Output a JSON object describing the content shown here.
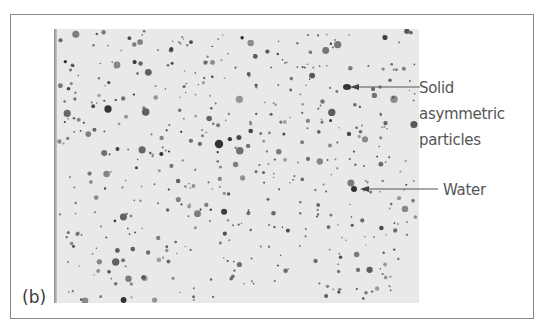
{
  "figure": {
    "panel_label": "(b)",
    "annotations": [
      {
        "id": "solid",
        "lines": [
          "Solid",
          "asymmetric",
          "particles"
        ]
      },
      {
        "id": "water",
        "lines": [
          "Water"
        ]
      }
    ]
  },
  "micrograph": {
    "background": "#e9e9e7",
    "particle_color": "#3c3c3c",
    "seed": 7,
    "particle_count": 520
  }
}
